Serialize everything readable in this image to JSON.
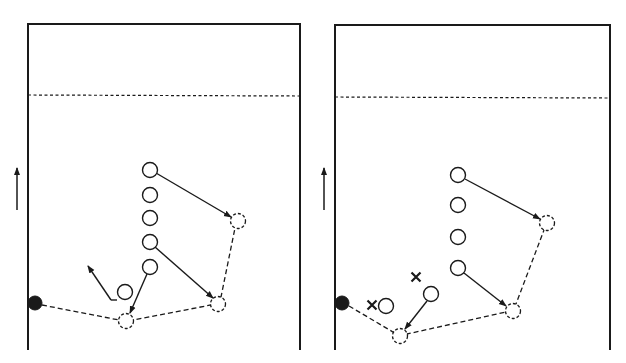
{
  "colors": {
    "background": "#ffffff",
    "ink": "#1a1a1a"
  },
  "panels": [
    {
      "id": "left",
      "court": {
        "x1": 28,
        "y1": 24,
        "x2": 300,
        "y2": 350
      },
      "dotted_line_y": 95,
      "direction_arrow": {
        "x": 17,
        "y_from": 210,
        "y_to": 168
      },
      "ball": {
        "x": 35,
        "y": 303,
        "r": 7
      },
      "players": [
        {
          "x": 150,
          "y": 170
        },
        {
          "x": 150,
          "y": 195
        },
        {
          "x": 150,
          "y": 218
        },
        {
          "x": 150,
          "y": 242
        },
        {
          "x": 150,
          "y": 267
        },
        {
          "x": 125,
          "y": 292
        }
      ],
      "ghost_positions": [
        {
          "x": 238,
          "y": 221
        },
        {
          "x": 218,
          "y": 304
        },
        {
          "x": 126,
          "y": 321
        }
      ],
      "crosses": [],
      "moves": [
        {
          "x1": 156,
          "y1": 173,
          "x2": 231,
          "y2": 217
        },
        {
          "x1": 155,
          "y1": 247,
          "x2": 213,
          "y2": 298
        },
        {
          "x1": 147,
          "y1": 274,
          "x2": 130,
          "y2": 313
        },
        {
          "x1": 117,
          "y1": 300,
          "x2": 111,
          "y2": 300,
          "noarrow": true
        },
        {
          "x1": 111,
          "y1": 300,
          "x2": 88,
          "y2": 266
        }
      ],
      "pass_path": [
        {
          "x": 42,
          "y": 305
        },
        {
          "x": 119,
          "y": 320
        },
        {
          "x": 133,
          "y": 320
        },
        {
          "x": 211,
          "y": 305
        },
        {
          "x": 221,
          "y": 297
        },
        {
          "x": 235,
          "y": 228
        }
      ]
    },
    {
      "id": "right",
      "court": {
        "x1": 335,
        "y1": 25,
        "x2": 610,
        "y2": 350
      },
      "dotted_line_y": 97,
      "direction_arrow": {
        "x": 324,
        "y_from": 210,
        "y_to": 168
      },
      "ball": {
        "x": 342,
        "y": 303,
        "r": 7
      },
      "players": [
        {
          "x": 458,
          "y": 175
        },
        {
          "x": 458,
          "y": 205
        },
        {
          "x": 458,
          "y": 237
        },
        {
          "x": 458,
          "y": 268
        },
        {
          "x": 431,
          "y": 294
        },
        {
          "x": 386,
          "y": 306
        }
      ],
      "ghost_positions": [
        {
          "x": 547,
          "y": 223
        },
        {
          "x": 513,
          "y": 311
        },
        {
          "x": 400,
          "y": 336
        }
      ],
      "crosses": [
        {
          "x": 372,
          "y": 305
        },
        {
          "x": 416,
          "y": 277
        }
      ],
      "moves": [
        {
          "x1": 465,
          "y1": 179,
          "x2": 540,
          "y2": 219
        },
        {
          "x1": 464,
          "y1": 273,
          "x2": 506,
          "y2": 306
        },
        {
          "x1": 427,
          "y1": 301,
          "x2": 405,
          "y2": 329
        }
      ],
      "pass_path": [
        {
          "x": 349,
          "y": 306
        },
        {
          "x": 393,
          "y": 332
        },
        {
          "x": 407,
          "y": 334
        },
        {
          "x": 506,
          "y": 312
        },
        {
          "x": 516,
          "y": 304
        },
        {
          "x": 544,
          "y": 230
        }
      ]
    }
  ]
}
